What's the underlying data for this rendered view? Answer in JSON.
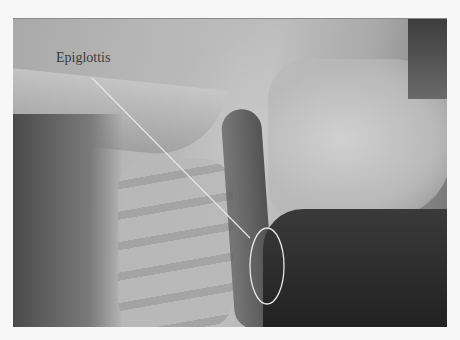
{
  "figure": {
    "type": "lateral neck radiograph",
    "annotation": {
      "label": "Epiglottis",
      "leader_line": {
        "x1": 92,
        "y1": 78,
        "x2": 250,
        "y2": 238,
        "color": "#e6e6e6"
      },
      "ellipse": {
        "cx": 267,
        "cy": 266,
        "rx": 17,
        "ry": 38,
        "color": "#e6e6e6"
      }
    }
  }
}
